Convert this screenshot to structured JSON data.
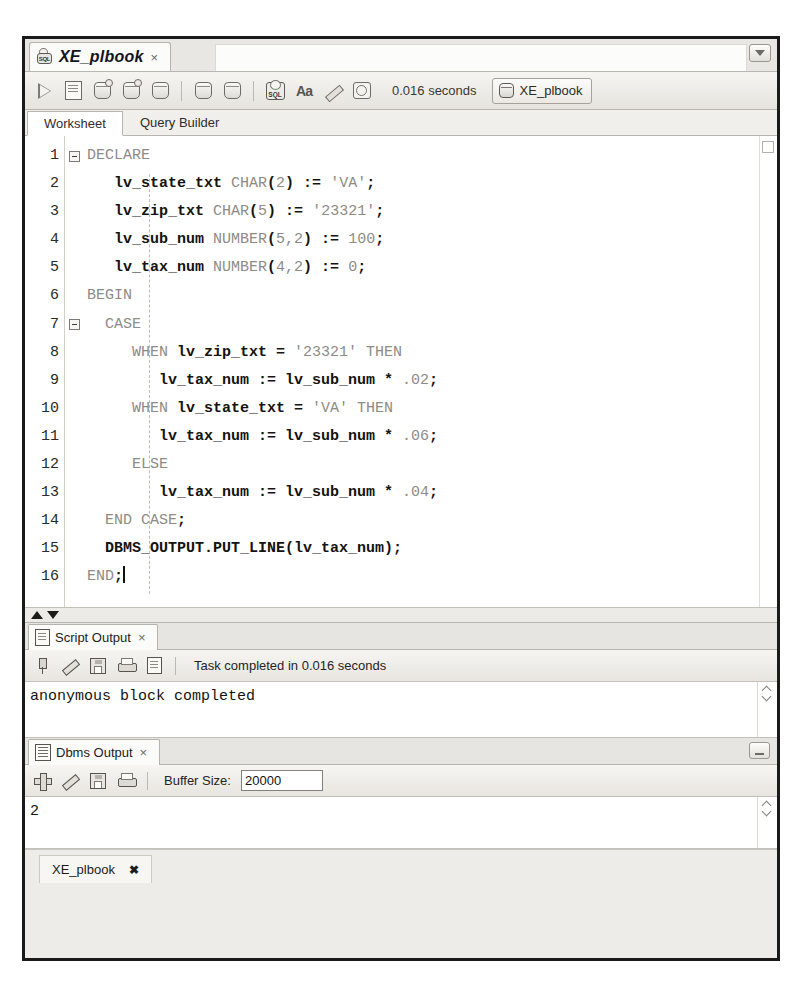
{
  "worksheet_tab": {
    "title": "XE_plbook",
    "close_label": "×",
    "icon": "sql-worksheet-icon",
    "menu_icon": "chevron-down-icon"
  },
  "toolbar": {
    "buttons": [
      {
        "name": "run-statement-button",
        "icon": "run-triangle-icon"
      },
      {
        "name": "run-script-button",
        "icon": "script-page-icon"
      },
      {
        "name": "commit-button",
        "icon": "commit-db-icon"
      },
      {
        "name": "rollback-button",
        "icon": "rollback-db-icon"
      },
      {
        "name": "unshared-sql-worksheet-button",
        "icon": "db-search-icon"
      },
      {
        "name": "explain-plan-button",
        "icon": "explain-plan-icon"
      },
      {
        "name": "autotrace-button",
        "icon": "autotrace-db-icon"
      },
      {
        "name": "sql-history-button",
        "icon": "sql-badge-icon"
      },
      {
        "name": "format-button",
        "icon": "aa-font-icon"
      },
      {
        "name": "clear-worksheet-button",
        "icon": "eraser-icon"
      },
      {
        "name": "query-history-button",
        "icon": "clock-history-icon"
      }
    ],
    "elapsed_time": "0.016 seconds",
    "connection": "XE_plbook",
    "connection_icon": "database-icon"
  },
  "subtabs": [
    {
      "label": "Worksheet",
      "active": true
    },
    {
      "label": "Query Builder",
      "active": false
    }
  ],
  "editor": {
    "line_numbers": [
      "1",
      "2",
      "3",
      "4",
      "5",
      "6",
      "7",
      "8",
      "9",
      "10",
      "11",
      "12",
      "13",
      "14",
      "15",
      "16"
    ],
    "fold_lines": [
      1,
      7
    ],
    "lines": [
      {
        "n": 1,
        "tokens": [
          {
            "t": "DECLARE",
            "c": "kw"
          }
        ]
      },
      {
        "n": 2,
        "tokens": [
          {
            "t": "   ",
            "c": "plain"
          },
          {
            "t": "lv_state_txt ",
            "c": "id"
          },
          {
            "t": "CHAR",
            "c": "kw"
          },
          {
            "t": "(",
            "c": "op"
          },
          {
            "t": "2",
            "c": "num"
          },
          {
            "t": ")",
            "c": "op"
          },
          {
            "t": " := ",
            "c": "op"
          },
          {
            "t": "'VA'",
            "c": "str"
          },
          {
            "t": ";",
            "c": "op"
          }
        ]
      },
      {
        "n": 3,
        "tokens": [
          {
            "t": "   ",
            "c": "plain"
          },
          {
            "t": "lv_zip_txt ",
            "c": "id"
          },
          {
            "t": "CHAR",
            "c": "kw"
          },
          {
            "t": "(",
            "c": "op"
          },
          {
            "t": "5",
            "c": "num"
          },
          {
            "t": ")",
            "c": "op"
          },
          {
            "t": " := ",
            "c": "op"
          },
          {
            "t": "'23321'",
            "c": "str"
          },
          {
            "t": ";",
            "c": "op"
          }
        ]
      },
      {
        "n": 4,
        "tokens": [
          {
            "t": "   ",
            "c": "plain"
          },
          {
            "t": "lv_sub_num ",
            "c": "id"
          },
          {
            "t": "NUMBER",
            "c": "kw"
          },
          {
            "t": "(",
            "c": "op"
          },
          {
            "t": "5,2",
            "c": "num"
          },
          {
            "t": ")",
            "c": "op"
          },
          {
            "t": " := ",
            "c": "op"
          },
          {
            "t": "100",
            "c": "num"
          },
          {
            "t": ";",
            "c": "op"
          }
        ]
      },
      {
        "n": 5,
        "tokens": [
          {
            "t": "   ",
            "c": "plain"
          },
          {
            "t": "lv_tax_num ",
            "c": "id"
          },
          {
            "t": "NUMBER",
            "c": "kw"
          },
          {
            "t": "(",
            "c": "op"
          },
          {
            "t": "4,2",
            "c": "num"
          },
          {
            "t": ")",
            "c": "op"
          },
          {
            "t": " := ",
            "c": "op"
          },
          {
            "t": "0",
            "c": "num"
          },
          {
            "t": ";",
            "c": "op"
          }
        ]
      },
      {
        "n": 6,
        "tokens": [
          {
            "t": "BEGIN",
            "c": "kw"
          }
        ]
      },
      {
        "n": 7,
        "tokens": [
          {
            "t": "  ",
            "c": "plain"
          },
          {
            "t": "CASE",
            "c": "kw"
          }
        ]
      },
      {
        "n": 8,
        "tokens": [
          {
            "t": "     ",
            "c": "plain"
          },
          {
            "t": "WHEN ",
            "c": "kw"
          },
          {
            "t": "lv_zip_txt",
            "c": "id"
          },
          {
            "t": " = ",
            "c": "op"
          },
          {
            "t": "'23321'",
            "c": "str"
          },
          {
            "t": " ",
            "c": "plain"
          },
          {
            "t": "THEN",
            "c": "kw"
          }
        ]
      },
      {
        "n": 9,
        "tokens": [
          {
            "t": "        ",
            "c": "plain"
          },
          {
            "t": "lv_tax_num",
            "c": "id"
          },
          {
            "t": " := ",
            "c": "op"
          },
          {
            "t": "lv_sub_num",
            "c": "id"
          },
          {
            "t": " * ",
            "c": "op"
          },
          {
            "t": ".02",
            "c": "num"
          },
          {
            "t": ";",
            "c": "op"
          }
        ]
      },
      {
        "n": 10,
        "tokens": [
          {
            "t": "     ",
            "c": "plain"
          },
          {
            "t": "WHEN ",
            "c": "kw"
          },
          {
            "t": "lv_state_txt",
            "c": "id"
          },
          {
            "t": " = ",
            "c": "op"
          },
          {
            "t": "'VA'",
            "c": "str"
          },
          {
            "t": " ",
            "c": "plain"
          },
          {
            "t": "THEN",
            "c": "kw"
          }
        ]
      },
      {
        "n": 11,
        "tokens": [
          {
            "t": "        ",
            "c": "plain"
          },
          {
            "t": "lv_tax_num",
            "c": "id"
          },
          {
            "t": " := ",
            "c": "op"
          },
          {
            "t": "lv_sub_num",
            "c": "id"
          },
          {
            "t": " * ",
            "c": "op"
          },
          {
            "t": ".06",
            "c": "num"
          },
          {
            "t": ";",
            "c": "op"
          }
        ]
      },
      {
        "n": 12,
        "tokens": [
          {
            "t": "     ",
            "c": "plain"
          },
          {
            "t": "ELSE",
            "c": "kw"
          }
        ]
      },
      {
        "n": 13,
        "tokens": [
          {
            "t": "        ",
            "c": "plain"
          },
          {
            "t": "lv_tax_num",
            "c": "id"
          },
          {
            "t": " := ",
            "c": "op"
          },
          {
            "t": "lv_sub_num",
            "c": "id"
          },
          {
            "t": " * ",
            "c": "op"
          },
          {
            "t": ".04",
            "c": "num"
          },
          {
            "t": ";",
            "c": "op"
          }
        ]
      },
      {
        "n": 14,
        "tokens": [
          {
            "t": "  ",
            "c": "plain"
          },
          {
            "t": "END CASE",
            "c": "kw"
          },
          {
            "t": ";",
            "c": "op"
          }
        ]
      },
      {
        "n": 15,
        "tokens": [
          {
            "t": "  ",
            "c": "plain"
          },
          {
            "t": "DBMS_OUTPUT.PUT_LINE",
            "c": "id"
          },
          {
            "t": "(",
            "c": "op"
          },
          {
            "t": "lv_tax_num",
            "c": "id"
          },
          {
            "t": ")",
            "c": "op"
          },
          {
            "t": ";",
            "c": "op"
          }
        ]
      },
      {
        "n": 16,
        "tokens": [
          {
            "t": "END",
            "c": "kw"
          },
          {
            "t": ";",
            "c": "op"
          },
          {
            "t": "CARET",
            "c": "caret"
          }
        ]
      }
    ]
  },
  "script_output": {
    "tab_label": "Script Output",
    "tab_close": "×",
    "tab_icon": "script-output-icon",
    "buttons": [
      {
        "name": "pin-output-button",
        "icon": "pin-icon"
      },
      {
        "name": "clear-output-button",
        "icon": "eraser-icon"
      },
      {
        "name": "save-output-button",
        "icon": "save-disk-icon"
      },
      {
        "name": "print-output-button",
        "icon": "printer-icon"
      },
      {
        "name": "open-output-button",
        "icon": "document-icon"
      }
    ],
    "status": "Task completed in 0.016 seconds",
    "content": "anonymous block completed"
  },
  "dbms_output": {
    "tab_label": "Dbms Output",
    "tab_close": "×",
    "tab_icon": "dbms-output-icon",
    "restore_icon": "restore-window-icon",
    "buttons": [
      {
        "name": "enable-dbms-output-button",
        "icon": "plus-icon"
      },
      {
        "name": "clear-dbms-output-button",
        "icon": "eraser-icon"
      },
      {
        "name": "save-dbms-output-button",
        "icon": "save-disk-icon"
      },
      {
        "name": "print-dbms-output-button",
        "icon": "printer-icon"
      }
    ],
    "buffer_label": "Buffer Size:",
    "buffer_size": "20000",
    "content": "2"
  },
  "bottom_tab": {
    "label": "XE_plbook",
    "close": "✖"
  }
}
